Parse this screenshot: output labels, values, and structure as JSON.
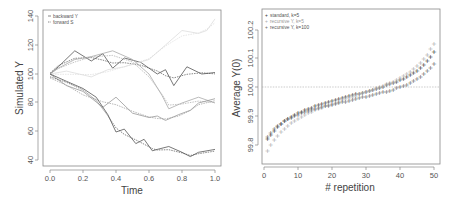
{
  "chart_data": [
    {
      "type": "line",
      "title": "",
      "xlabel": "Time",
      "ylabel": "Simulated Y",
      "xlim": [
        0.0,
        1.0
      ],
      "ylim": [
        38,
        142
      ],
      "x_ticks": [
        "0.0",
        "0.2",
        "0.4",
        "0.6",
        "0.8",
        "1.0"
      ],
      "y_ticks": [
        "40",
        "60",
        "80",
        "100",
        "120",
        "140"
      ],
      "grid": false,
      "legend_position": "top-left",
      "legend": [
        {
          "label": "backward Y",
          "style": "solid"
        },
        {
          "label": "forward S",
          "style": "dashed"
        }
      ],
      "series": [
        {
          "name": "path 1",
          "color": "#555555",
          "x": [
            0.0,
            0.05,
            0.15,
            0.25,
            0.32,
            0.38,
            0.45,
            0.55,
            0.65,
            0.7,
            0.75,
            0.83,
            0.92,
            1.0
          ],
          "values": [
            100,
            105,
            116,
            109,
            114,
            104,
            111,
            108,
            100,
            103,
            92,
            105,
            100,
            101
          ]
        },
        {
          "name": "path 2",
          "color": "#dddddd",
          "x": [
            0.0,
            0.1,
            0.25,
            0.35,
            0.45,
            0.6,
            0.7,
            0.8,
            0.9,
            0.95,
            1.0
          ],
          "values": [
            100,
            102,
            98,
            103,
            105,
            110,
            120,
            130,
            128,
            130,
            138
          ]
        },
        {
          "name": "path 3",
          "color": "#aaaaaa",
          "x": [
            0.0,
            0.05,
            0.15,
            0.25,
            0.38,
            0.5,
            0.6,
            0.68,
            0.72,
            0.8,
            0.9,
            1.0
          ],
          "values": [
            100,
            104,
            110,
            112,
            116,
            110,
            100,
            85,
            76,
            80,
            84,
            80
          ]
        },
        {
          "name": "path 4",
          "color": "#999999",
          "x": [
            0.0,
            0.1,
            0.2,
            0.32,
            0.4,
            0.5,
            0.6,
            0.65,
            0.7,
            0.78,
            0.85,
            0.9,
            1.0
          ],
          "values": [
            100,
            92,
            88,
            77,
            84,
            73,
            70,
            71,
            68,
            72,
            75,
            80,
            83
          ]
        },
        {
          "name": "path 5",
          "color": "#555555",
          "x": [
            0.0,
            0.1,
            0.2,
            0.28,
            0.35,
            0.4,
            0.45,
            0.52,
            0.57,
            0.62,
            0.65,
            0.72,
            0.8,
            0.85,
            0.9,
            1.0
          ],
          "values": [
            100,
            95,
            90,
            84,
            72,
            60,
            62,
            52,
            55,
            47,
            48,
            50,
            46,
            43,
            46,
            48
          ]
        }
      ]
    },
    {
      "type": "scatter",
      "title": "",
      "xlabel": "# repetition",
      "ylabel": "Average Y(0)",
      "xlim": [
        0,
        51
      ],
      "ylim": [
        99.74,
        100.26
      ],
      "x_ticks": [
        "0",
        "10",
        "20",
        "30",
        "40",
        "50"
      ],
      "y_ticks": [
        "99.8",
        "99.9",
        "100.0",
        "100.1",
        "100.2"
      ],
      "reference_line": {
        "y": 100.0,
        "style": "dashed"
      },
      "grid": false,
      "legend_position": "top-left",
      "marker": "+",
      "legend": [
        {
          "label": "standard, k=5",
          "color": "#333333"
        },
        {
          "label": "recursive Y, k=5",
          "color": "#aaaaaa"
        },
        {
          "label": "recursive Y, k=100",
          "color": "#666666"
        }
      ],
      "series": [
        {
          "name": "standard, k=5",
          "color": "#333333",
          "x_start": 1,
          "x_step": 1,
          "count": 50,
          "range": [
            99.82,
            100.12
          ]
        },
        {
          "name": "recursive Y, k=5",
          "color": "#aaaaaa",
          "x_start": 1,
          "x_step": 1,
          "count": 50,
          "range": [
            99.78,
            100.15
          ]
        },
        {
          "name": "recursive Y, k=100",
          "color": "#666666",
          "x_start": 1,
          "x_step": 1,
          "count": 50,
          "range": [
            99.83,
            100.08
          ]
        }
      ]
    }
  ],
  "left_plot": {
    "xlabel": "Time",
    "ylabel": "Simulated Y",
    "x_ticks": [
      "0.0",
      "0.2",
      "0.4",
      "0.6",
      "0.8",
      "1.0"
    ],
    "y_ticks": [
      "40",
      "60",
      "80",
      "100",
      "120",
      "140"
    ],
    "legend": [
      "backward Y",
      "forward S"
    ]
  },
  "right_plot": {
    "xlabel": "# repetition",
    "ylabel": "Average Y(0)",
    "x_ticks": [
      "0",
      "10",
      "20",
      "30",
      "40",
      "50"
    ],
    "y_ticks": [
      "99.8",
      "99.9",
      "100.0",
      "100.1",
      "100.2"
    ],
    "legend": [
      "standard, k=5",
      "recursive Y, k=5",
      "recursive Y, k=100"
    ]
  }
}
